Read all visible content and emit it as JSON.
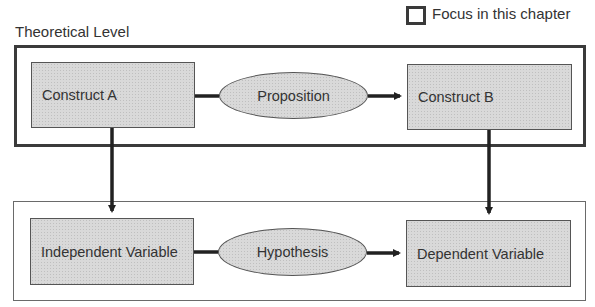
{
  "legend": {
    "label": "Focus in this chapter",
    "icon": "square-outline-icon"
  },
  "theoretical_level": {
    "title": "Theoretical Level",
    "left_node": "Construct A",
    "relation": "Proposition",
    "right_node": "Construct B"
  },
  "empirical_level": {
    "left_node": "Independent Variable",
    "relation": "Hypothesis",
    "right_node": "Dependent Variable"
  },
  "colors": {
    "node_fill": "#d9d9d9",
    "stroke": "#2a2a2a",
    "background": "#ffffff"
  }
}
